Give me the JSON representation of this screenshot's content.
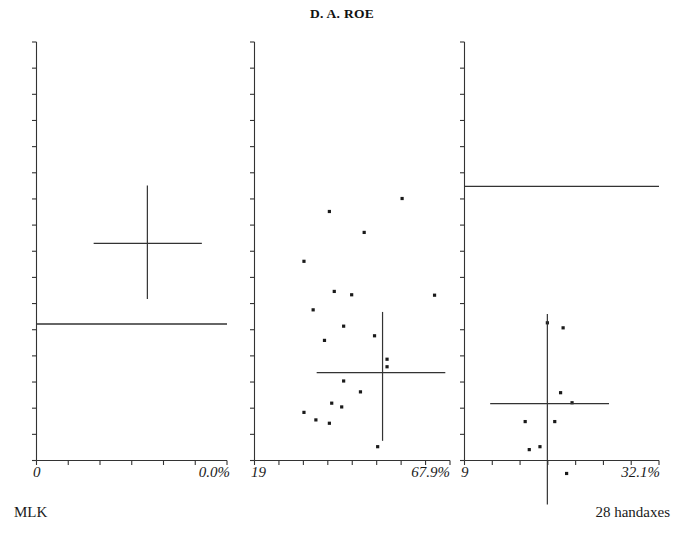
{
  "figure": {
    "title": "D. A. ROE",
    "caption_left": "MLK",
    "caption_right": "28 handaxes"
  },
  "chart_data": {
    "type": "scatter",
    "title": "D. A. ROE",
    "subtitle": "",
    "xlabel": "",
    "ylabel": "",
    "grid": false,
    "legend": null,
    "panels": [
      {
        "id": "panel-1",
        "index": 1,
        "x_tick_label_left": "0",
        "x_tick_label_right": "0.0%",
        "x_min_label": "0",
        "x_max_label": "0.0%",
        "n_points": 0,
        "points": [],
        "mean_cross": {
          "cx_frac": 0.582,
          "cy_frac": 0.481,
          "x_lo_frac": 0.3,
          "x_hi_frac": 0.868,
          "y_lo_frac": 0.343,
          "y_hi_frac": 0.614
        },
        "reference_line": {
          "y_frac": 0.674,
          "x_start_frac": 0.0,
          "x_end_frac": 1.0
        },
        "y_ticks": 16,
        "x_ticks": 6
      },
      {
        "id": "panel-2",
        "index": 2,
        "x_tick_label_left": "19",
        "x_tick_label_right": "67.9%",
        "x_min_label": "19",
        "x_max_label": "67.9%",
        "n_points": 21,
        "points": [
          [
            0.755,
            0.374
          ],
          [
            0.383,
            0.405
          ],
          [
            0.561,
            0.455
          ],
          [
            0.253,
            0.524
          ],
          [
            0.408,
            0.596
          ],
          [
            0.497,
            0.604
          ],
          [
            0.3,
            0.64
          ],
          [
            0.921,
            0.605
          ],
          [
            0.456,
            0.679
          ],
          [
            0.358,
            0.713
          ],
          [
            0.678,
            0.758
          ],
          [
            0.678,
            0.776
          ],
          [
            0.456,
            0.81
          ],
          [
            0.542,
            0.836
          ],
          [
            0.395,
            0.863
          ],
          [
            0.446,
            0.872
          ],
          [
            0.253,
            0.885
          ],
          [
            0.314,
            0.903
          ],
          [
            0.383,
            0.911
          ],
          [
            0.63,
            0.967
          ],
          [
            0.614,
            0.702
          ]
        ],
        "mean_cross": {
          "cx_frac": 0.655,
          "cy_frac": 0.79,
          "x_lo_frac": 0.318,
          "x_hi_frac": 0.976,
          "y_lo_frac": 0.645,
          "y_hi_frac": 0.953
        },
        "reference_line": null,
        "y_ticks": 16,
        "x_ticks": 8
      },
      {
        "id": "panel-3",
        "index": 3,
        "x_tick_label_left": "9",
        "x_tick_label_right": "32.1%",
        "x_min_label": "9",
        "x_max_label": "32.1%",
        "n_points": 9,
        "points": [
          [
            0.426,
            0.671
          ],
          [
            0.507,
            0.683
          ],
          [
            0.494,
            0.838
          ],
          [
            0.553,
            0.862
          ],
          [
            0.312,
            0.907
          ],
          [
            0.464,
            0.907
          ],
          [
            0.388,
            0.967
          ],
          [
            0.333,
            0.974
          ],
          [
            0.525,
            1.031
          ]
        ],
        "mean_cross": {
          "cx_frac": 0.426,
          "cy_frac": 0.864,
          "x_lo_frac": 0.132,
          "x_hi_frac": 0.743,
          "y_lo_frac": 0.65,
          "y_hi_frac": 1.105
        },
        "reference_line": {
          "y_frac": 0.345,
          "x_start_frac": 0.0,
          "x_end_frac": 1.0
        },
        "y_ticks": 16,
        "x_ticks": 7
      }
    ]
  }
}
